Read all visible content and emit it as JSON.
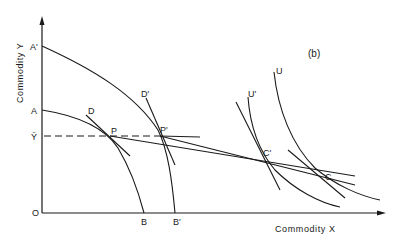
{
  "figure": {
    "panel_label": "(b)",
    "x_axis_title": "Commodity X",
    "y_axis_title": "Commodity Y",
    "origin_label": "O"
  },
  "axis_labels": {
    "A_prime": "A'",
    "A": "A",
    "Y_bar": "Ȳ",
    "B": "B",
    "B_prime": "B'"
  },
  "curve_labels": {
    "D": "D",
    "D_prime": "D'",
    "U_prime": "U'",
    "U": "U"
  },
  "point_labels": {
    "P": "P",
    "P_prime": "P'",
    "C_prime": "C'",
    "C": "C"
  },
  "colors": {
    "ink": "#1a1a1a",
    "background": "#ffffff"
  }
}
